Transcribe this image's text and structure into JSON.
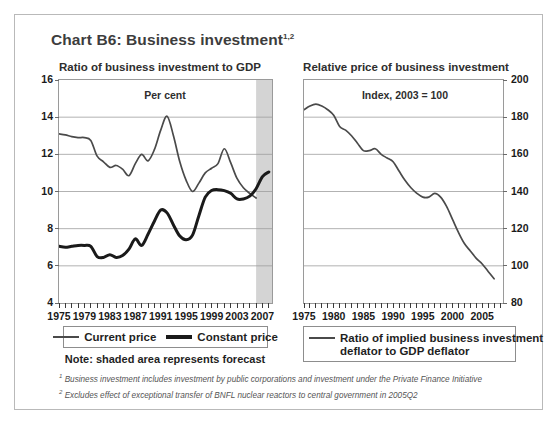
{
  "chart": {
    "title": "Chart B6: Business investment",
    "title_superscript": "1,2"
  },
  "left_panel": {
    "heading": "Ratio of business investment to GDP",
    "subtitle": "Per cent",
    "y_ticks": [
      "16",
      "14",
      "12",
      "10",
      "8",
      "6",
      "4"
    ],
    "x_ticks": [
      "1975",
      "1979",
      "1983",
      "1987",
      "1991",
      "1995",
      "1999",
      "2003",
      "2007"
    ],
    "legend": [
      {
        "label": "Current price",
        "style": "thin",
        "color": "#4a4a4a"
      },
      {
        "label": "Constant price",
        "style": "thick",
        "color": "#1a1a1a"
      }
    ],
    "note": "Note: shaded area represents forecast"
  },
  "right_panel": {
    "heading": "Relative price of business investment",
    "subtitle": "Index, 2003 = 100",
    "y_ticks": [
      "200",
      "180",
      "160",
      "140",
      "120",
      "100",
      "80"
    ],
    "x_ticks": [
      "1975",
      "1980",
      "1985",
      "1990",
      "1995",
      "2000",
      "2005"
    ],
    "legend": [
      {
        "label": "Ratio of implied business investment",
        "style": "thin",
        "color": "#4a4a4a"
      },
      {
        "label": "deflator to GDP deflator",
        "style": "none",
        "color": "#4a4a4a"
      }
    ]
  },
  "footnotes": [
    {
      "marker": "1",
      "text": "Business investment includes investment by public corporations and investment under the Private Finance Initiative"
    },
    {
      "marker": "2",
      "text": "Excludes effect of exceptional transfer of BNFL nuclear reactors to central government in 2005Q2"
    }
  ],
  "colors": {
    "frame_border": "#b9b9b9",
    "plot_border": "#9a9a9a",
    "gridline": "#9e9e9e",
    "forecast_shade": "#d4d4d4",
    "title_text": "#3d3d3d",
    "current_price_line": "#4a4a4a",
    "constant_price_line": "#1a1a1a",
    "relative_price_line": "#4a4a4a"
  },
  "chart_data": [
    {
      "type": "line",
      "id": "ratio-of-business-investment-to-gdp",
      "title": "Ratio of business investment to GDP",
      "subtitle": "Per cent",
      "xlabel": "",
      "ylabel": "Per cent",
      "xlim": [
        1975,
        2008.5
      ],
      "ylim": [
        4,
        16
      ],
      "ytick_step": 2,
      "xtick_step": 4,
      "grid": true,
      "legend_position": "below",
      "forecast_shading": {
        "from": 2006.0,
        "to": 2008.5,
        "color": "#d4d4d4"
      },
      "x": [
        1975,
        1976,
        1977,
        1978,
        1979,
        1980,
        1981,
        1982,
        1983,
        1984,
        1985,
        1986,
        1987,
        1988,
        1989,
        1990,
        1991,
        1992,
        1993,
        1994,
        1995,
        1996,
        1997,
        1998,
        1999,
        2000,
        2001,
        2002,
        2003,
        2004,
        2005,
        2006,
        2007,
        2008
      ],
      "series": [
        {
          "name": "Current price",
          "style": "thin",
          "color": "#4a4a4a",
          "values": [
            13.1,
            13.05,
            12.95,
            12.9,
            12.9,
            12.75,
            11.9,
            11.6,
            11.3,
            11.4,
            11.2,
            10.85,
            11.5,
            12.0,
            11.65,
            12.25,
            13.3,
            14.05,
            13.0,
            11.6,
            10.6,
            10.0,
            10.45,
            11.0,
            11.25,
            11.5,
            12.3,
            11.55,
            10.7,
            10.2,
            9.9,
            9.65,
            null,
            null
          ]
        },
        {
          "name": "Constant price",
          "style": "thick",
          "color": "#1a1a1a",
          "values": [
            7.05,
            7.0,
            7.05,
            7.1,
            7.1,
            7.05,
            6.5,
            6.45,
            6.6,
            6.45,
            6.55,
            6.9,
            7.45,
            7.1,
            7.7,
            8.4,
            9.0,
            8.85,
            8.2,
            7.6,
            7.4,
            7.65,
            8.7,
            9.7,
            10.05,
            10.1,
            10.05,
            9.9,
            9.6,
            9.6,
            9.75,
            10.15,
            10.8,
            11.05
          ]
        }
      ]
    },
    {
      "type": "line",
      "id": "relative-price-of-business-investment",
      "title": "Relative price of business investment",
      "subtitle": "Index, 2003 = 100",
      "xlabel": "",
      "ylabel": "Index, 2003 = 100",
      "xlim": [
        1975,
        2008.5
      ],
      "ylim": [
        80,
        200
      ],
      "ytick_step": 20,
      "xtick_step": 5,
      "grid": true,
      "legend_position": "below",
      "x": [
        1975,
        1976,
        1977,
        1978,
        1979,
        1980,
        1981,
        1982,
        1983,
        1984,
        1985,
        1986,
        1987,
        1988,
        1989,
        1990,
        1991,
        1992,
        1993,
        1994,
        1995,
        1996,
        1997,
        1998,
        1999,
        2000,
        2001,
        2002,
        2003,
        2004,
        2005,
        2006,
        2007
      ],
      "series": [
        {
          "name": "Ratio of implied business investment deflator to GDP deflator",
          "style": "thin",
          "color": "#4a4a4a",
          "values": [
            184,
            186,
            187,
            186,
            184,
            181,
            175,
            173,
            170,
            166,
            162,
            162,
            163,
            160,
            158,
            156,
            151,
            146,
            142,
            139,
            137,
            137,
            139,
            137,
            132,
            125,
            118,
            112,
            108,
            104,
            101,
            97,
            93
          ]
        }
      ]
    }
  ]
}
